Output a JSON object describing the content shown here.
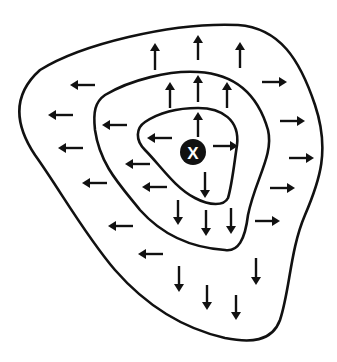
{
  "diagram": {
    "center": {
      "label": "X",
      "x": 193,
      "y": 152,
      "r": 13
    },
    "colors": {
      "line": "#111111",
      "background": "#ffffff",
      "center_fill": "#111111",
      "center_text": "#ffffff"
    },
    "contours": [
      {
        "name": "outer-contour",
        "d": "M 40 70 C 80 45, 170 22, 238 25 C 280 28, 300 60, 315 105 C 330 150, 320 180, 305 215 C 290 250, 290 290, 280 320 C 272 342, 250 343, 225 338 C 190 330, 150 310, 115 270 C 85 235, 60 190, 35 155 C 15 125, 12 95, 40 70 Z"
      },
      {
        "name": "middle-contour",
        "d": "M 105 95 C 130 80, 170 70, 198 72 C 235 74, 258 95, 268 130 C 274 155, 255 180, 248 215 C 245 240, 238 252, 225 250 C 195 248, 165 238, 140 210 C 120 185, 100 165, 95 130 C 93 112, 95 102, 105 95 Z"
      },
      {
        "name": "inner-contour",
        "d": "M 145 122 C 160 112, 180 108, 198 108 C 222 108, 240 120, 237 145 C 234 165, 232 185, 228 198 C 224 206, 210 206, 195 198 C 175 188, 160 165, 145 150 C 135 140, 136 128, 145 122 Z"
      }
    ],
    "arrows": [
      {
        "dir": "up",
        "x": 155,
        "y1": 70,
        "y2": 43
      },
      {
        "dir": "up",
        "x": 198,
        "y1": 60,
        "y2": 35
      },
      {
        "dir": "up",
        "x": 240,
        "y1": 68,
        "y2": 42
      },
      {
        "dir": "up",
        "x": 170,
        "y1": 108,
        "y2": 82
      },
      {
        "dir": "up",
        "x": 198,
        "y1": 102,
        "y2": 75
      },
      {
        "dir": "up",
        "x": 227,
        "y1": 108,
        "y2": 82
      },
      {
        "dir": "up",
        "x": 198,
        "y1": 137,
        "y2": 112
      },
      {
        "dir": "left",
        "y": 85,
        "x1": 95,
        "x2": 70
      },
      {
        "dir": "left",
        "y": 115,
        "x1": 73,
        "x2": 48
      },
      {
        "dir": "left",
        "y": 148,
        "x1": 83,
        "x2": 58
      },
      {
        "dir": "left",
        "y": 183,
        "x1": 107,
        "x2": 82
      },
      {
        "dir": "left",
        "y": 226,
        "x1": 133,
        "x2": 108
      },
      {
        "dir": "left",
        "y": 254,
        "x1": 163,
        "x2": 138
      },
      {
        "dir": "left",
        "y": 125,
        "x1": 127,
        "x2": 102
      },
      {
        "dir": "left",
        "y": 164,
        "x1": 150,
        "x2": 125
      },
      {
        "dir": "left",
        "y": 187,
        "x1": 167,
        "x2": 142
      },
      {
        "dir": "left",
        "y": 138,
        "x1": 172,
        "x2": 147
      },
      {
        "dir": "right",
        "y": 146,
        "x1": 213,
        "x2": 238
      },
      {
        "dir": "right",
        "y": 82,
        "x1": 262,
        "x2": 287
      },
      {
        "dir": "right",
        "y": 121,
        "x1": 280,
        "x2": 305
      },
      {
        "dir": "right",
        "y": 158,
        "x1": 289,
        "x2": 314
      },
      {
        "dir": "right",
        "y": 188,
        "x1": 270,
        "x2": 295
      },
      {
        "dir": "right",
        "y": 221,
        "x1": 255,
        "x2": 280
      },
      {
        "dir": "down",
        "x": 205,
        "y1": 172,
        "y2": 198
      },
      {
        "dir": "down",
        "x": 178,
        "y1": 200,
        "y2": 225
      },
      {
        "dir": "down",
        "x": 206,
        "y1": 210,
        "y2": 236
      },
      {
        "dir": "down",
        "x": 231,
        "y1": 208,
        "y2": 234
      },
      {
        "dir": "down",
        "x": 179,
        "y1": 266,
        "y2": 292
      },
      {
        "dir": "down",
        "x": 207,
        "y1": 285,
        "y2": 310
      },
      {
        "dir": "down",
        "x": 236,
        "y1": 295,
        "y2": 320
      },
      {
        "dir": "down",
        "x": 256,
        "y1": 258,
        "y2": 285
      }
    ]
  }
}
